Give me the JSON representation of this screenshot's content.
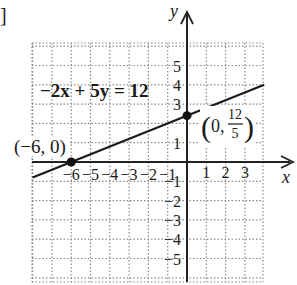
{
  "chart_data": {
    "type": "line",
    "title": "",
    "equation_label": "−2x + 5y = 12",
    "xlabel": "x",
    "ylabel": "y",
    "xlim": [
      -8,
      4
    ],
    "ylim": [
      -6.2,
      6.2
    ],
    "grid": true,
    "x_ticks": [
      -6,
      -5,
      -4,
      -3,
      -2,
      -1,
      1,
      2,
      3
    ],
    "x_tick_labels": [
      "−6",
      "−5",
      "−4",
      "−3",
      "−2",
      "−1",
      "1",
      "2",
      "3"
    ],
    "y_ticks": [
      5,
      4,
      3,
      1,
      -1,
      -2,
      -3,
      -4,
      -5
    ],
    "y_tick_labels": [
      "5",
      "4",
      "3",
      "1",
      "−1",
      "−2",
      "−3",
      "−4",
      "−5"
    ],
    "series": [
      {
        "name": "−2x + 5y = 12",
        "x": [
          -8,
          4
        ],
        "y": [
          -0.8,
          4
        ]
      }
    ],
    "points": [
      {
        "x": -6,
        "y": 0,
        "label": "(−6, 0)"
      },
      {
        "x": 0,
        "y": 2.4,
        "label": "(0, 12/5)",
        "label_num": "12",
        "label_den": "5",
        "label_prefix": "0,"
      }
    ]
  },
  "fragment": {
    "bracket": "]"
  }
}
